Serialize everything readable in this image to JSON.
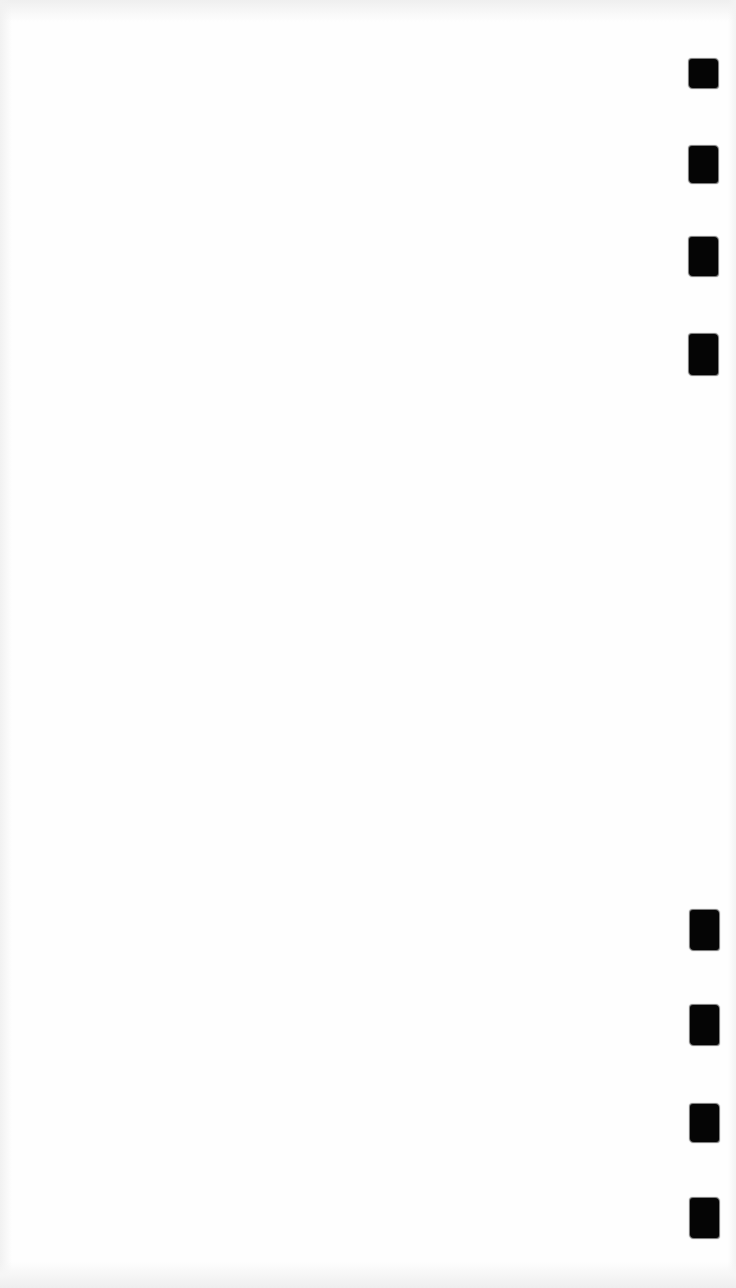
{
  "page": {
    "background": "#fefefe",
    "text": ""
  },
  "marks": {
    "color": "#050505",
    "top_group": [
      {
        "x": 689,
        "y": 59,
        "w": 29,
        "h": 29
      },
      {
        "x": 689,
        "y": 146,
        "w": 29,
        "h": 37
      },
      {
        "x": 689,
        "y": 237,
        "w": 29,
        "h": 39
      },
      {
        "x": 689,
        "y": 334,
        "w": 29,
        "h": 41
      }
    ],
    "bottom_group": [
      {
        "x": 690,
        "y": 910,
        "w": 29,
        "h": 40
      },
      {
        "x": 690,
        "y": 1005,
        "w": 29,
        "h": 40
      },
      {
        "x": 690,
        "y": 1104,
        "w": 29,
        "h": 38
      },
      {
        "x": 690,
        "y": 1198,
        "w": 29,
        "h": 40
      }
    ]
  }
}
